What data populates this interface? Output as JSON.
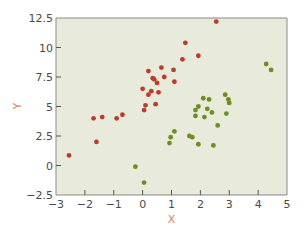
{
  "chart_data": {
    "type": "scatter",
    "title": "",
    "xlabel": "X",
    "ylabel": "Y",
    "xlim": [
      -3,
      5
    ],
    "ylim": [
      -2.5,
      12.5
    ],
    "x_ticks": [
      -3,
      -2,
      -1,
      0,
      1,
      2,
      3,
      4,
      5
    ],
    "x_tick_labels": [
      "−3",
      "−2",
      "−1",
      "0",
      "1",
      "2",
      "3",
      "4",
      "5"
    ],
    "y_ticks": [
      -2.5,
      0,
      2.5,
      5,
      7.5,
      10,
      12.5
    ],
    "y_tick_labels": [
      "−2.5",
      "0",
      "2.5",
      "5",
      "7.5",
      "10",
      "12.5"
    ],
    "grid": false,
    "legend": null,
    "background": "#e8ebdb",
    "series": [
      {
        "name": "red",
        "color": "#c0392b",
        "points": [
          [
            -2.55,
            0.85
          ],
          [
            -1.7,
            4.0
          ],
          [
            -1.6,
            2.0
          ],
          [
            -1.4,
            4.1
          ],
          [
            -0.9,
            4.0
          ],
          [
            -0.7,
            4.3
          ],
          [
            0.05,
            4.7
          ],
          [
            0.1,
            5.1
          ],
          [
            0.45,
            5.2
          ],
          [
            0.2,
            6.0
          ],
          [
            0.55,
            6.2
          ],
          [
            0.3,
            6.3
          ],
          [
            0.0,
            6.5
          ],
          [
            0.5,
            7.0
          ],
          [
            0.4,
            7.3
          ],
          [
            0.35,
            7.4
          ],
          [
            0.75,
            7.5
          ],
          [
            1.1,
            7.1
          ],
          [
            0.2,
            8.0
          ],
          [
            0.65,
            8.3
          ],
          [
            1.07,
            8.1
          ],
          [
            1.38,
            9.0
          ],
          [
            1.93,
            9.3
          ],
          [
            1.48,
            10.4
          ],
          [
            2.55,
            12.2
          ]
        ]
      },
      {
        "name": "green",
        "color": "#6b8e23",
        "points": [
          [
            -0.25,
            -0.1
          ],
          [
            0.05,
            -1.45
          ],
          [
            0.93,
            1.9
          ],
          [
            0.97,
            2.4
          ],
          [
            1.1,
            2.9
          ],
          [
            1.62,
            2.5
          ],
          [
            1.72,
            2.4
          ],
          [
            1.93,
            1.8
          ],
          [
            2.45,
            1.7
          ],
          [
            2.6,
            3.4
          ],
          [
            1.83,
            4.2
          ],
          [
            2.14,
            4.1
          ],
          [
            2.9,
            4.4
          ],
          [
            1.83,
            4.7
          ],
          [
            1.93,
            5.0
          ],
          [
            2.24,
            4.8
          ],
          [
            2.4,
            4.5
          ],
          [
            2.1,
            5.7
          ],
          [
            2.3,
            5.6
          ],
          [
            2.86,
            6.0
          ],
          [
            2.97,
            5.6
          ],
          [
            3.0,
            5.3
          ],
          [
            4.28,
            8.6
          ],
          [
            4.45,
            8.1
          ]
        ]
      }
    ]
  },
  "layout": {
    "plot_left": 56,
    "plot_right": 287,
    "plot_top": 18,
    "plot_bottom": 195
  }
}
